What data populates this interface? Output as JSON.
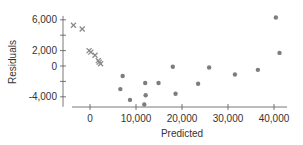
{
  "chart_data": {
    "type": "scatter",
    "title": "",
    "xlabel": "Predicted",
    "ylabel": "Residuals",
    "xlim": [
      -5000,
      42500
    ],
    "ylim": [
      -5500,
      6500
    ],
    "x_ticks": [
      0,
      10000,
      20000,
      30000,
      40000
    ],
    "x_tick_labels": [
      "0",
      "10,000",
      "20,000",
      "30,000",
      "40,000"
    ],
    "y_ticks": [
      6000,
      4000,
      2000,
      0,
      -2000,
      -4000
    ],
    "y_tick_labels": [
      "6,000",
      "",
      "2,000",
      "0",
      "",
      "-4,000"
    ],
    "grid": false,
    "legend": null,
    "series": [
      {
        "name": "group-x",
        "marker": "x",
        "color": "#8a8a8a",
        "points": [
          [
            -3600,
            5300
          ],
          [
            -1700,
            4800
          ],
          [
            -200,
            2000
          ],
          [
            200,
            1800
          ],
          [
            1100,
            1400
          ],
          [
            1800,
            700
          ],
          [
            2000,
            500
          ],
          [
            2300,
            300
          ]
        ]
      },
      {
        "name": "group-dot",
        "marker": "circle",
        "color": "#7d7d7d",
        "points": [
          [
            6600,
            -3000
          ],
          [
            7100,
            -1300
          ],
          [
            8700,
            -4400
          ],
          [
            12000,
            -2200
          ],
          [
            12100,
            -3800
          ],
          [
            11800,
            -5000
          ],
          [
            14900,
            -2200
          ],
          [
            18000,
            -100
          ],
          [
            18600,
            -3600
          ],
          [
            23500,
            -2300
          ],
          [
            25900,
            -200
          ],
          [
            31500,
            -1100
          ],
          [
            36500,
            -500
          ],
          [
            40400,
            6300
          ],
          [
            41200,
            1700
          ]
        ]
      }
    ]
  }
}
